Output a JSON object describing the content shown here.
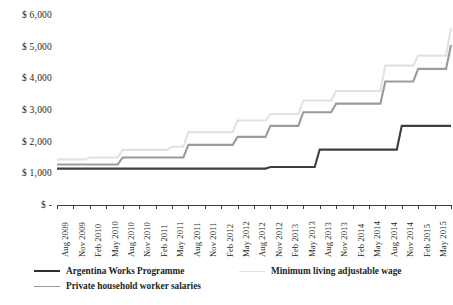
{
  "chart_data": {
    "type": "line",
    "title": "",
    "xlabel": "",
    "ylabel": "",
    "ylim": [
      0,
      6000
    ],
    "ytick_values": [
      0,
      1000,
      2000,
      3000,
      4000,
      5000,
      6000
    ],
    "ytick_labels": [
      "$ -",
      "$ 1,000",
      "$ 2,000",
      "$ 3,000",
      "$ 4,000",
      "$ 5,000",
      "$ 6,000"
    ],
    "grid": false,
    "legend_position": "bottom",
    "step_style": "post",
    "categories": [
      "Aug 2009",
      "Nov 2009",
      "Feb 2010",
      "May 2010",
      "Aug 2010",
      "Nov 2010",
      "Feb 2011",
      "May 2011",
      "Aug 2011",
      "Nov 2011",
      "Feb 2012",
      "May 2012",
      "Aug 2012",
      "Nov 2012",
      "Feb 2013",
      "May 2013",
      "Aug 2013",
      "Nov 2013",
      "Feb 2014",
      "May 2014",
      "Aug 2014",
      "Nov 2014",
      "Feb 2015",
      "May 2015",
      "Aug 2015"
    ],
    "series": [
      {
        "name": "Argentina Works Programme",
        "color": "#3f3f3f",
        "width": 2.1,
        "values": [
          1150,
          1150,
          1150,
          1150,
          1150,
          1150,
          1150,
          1150,
          1150,
          1150,
          1150,
          1150,
          1150,
          1200,
          1200,
          1200,
          1750,
          1750,
          1750,
          1750,
          1750,
          2500,
          2500,
          2500,
          2500
        ]
      },
      {
        "name": "Minimum living adjustable wage",
        "color": "#e2e2e2",
        "width": 2.1,
        "values": [
          1440,
          1440,
          1500,
          1500,
          1740,
          1740,
          1740,
          1840,
          2300,
          2300,
          2300,
          2670,
          2670,
          2875,
          2875,
          3300,
          3300,
          3600,
          3600,
          3600,
          4400,
          4400,
          4716,
          4716,
          5588
        ]
      },
      {
        "name": "Private household worker salaries",
        "color": "#9b9b9b",
        "width": 2.1,
        "values": [
          1280,
          1280,
          1280,
          1280,
          1500,
          1500,
          1500,
          1500,
          1900,
          1900,
          1900,
          2150,
          2150,
          2500,
          2500,
          2930,
          2930,
          3200,
          3200,
          3200,
          3900,
          3900,
          4300,
          4300,
          5050
        ]
      }
    ]
  },
  "legend": {
    "items": [
      {
        "label": "Argentina Works Programme",
        "color": "#2f2f2f"
      },
      {
        "label": "Minimum living adjustable wage",
        "color": "#e0e0e0"
      },
      {
        "label": "Private household worker salaries",
        "color": "#9b9b9b"
      }
    ]
  }
}
